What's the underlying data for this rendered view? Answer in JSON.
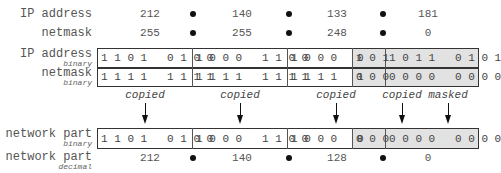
{
  "rows": {
    "ip_decimal": {
      "label": "IP address",
      "octets": [
        "212",
        "140",
        "133",
        "181"
      ]
    },
    "netmask_decimal": {
      "label": "netmask",
      "octets": [
        "255",
        "255",
        "248",
        "0"
      ]
    },
    "ip_binary": {
      "label": "IP address",
      "sublabel": "binary",
      "octets": [
        "1 1 0 1   0 1 0 0",
        "1 0 0 0   1 1 0 0",
        "1 0 0 0   0",
        "1 0 1",
        "1 0 1 1   0 1 0 1"
      ]
    },
    "netmask_binary": {
      "label": "netmask",
      "sublabel": "binary",
      "octets": [
        "1 1 1 1   1 1 1 1",
        "1 1 1 1   1 1 1 1",
        "1 1 1 1   1",
        "0 0 0",
        "0 0 0 0   0 0 0 0"
      ]
    },
    "network_binary": {
      "label": "network part",
      "sublabel": "binary",
      "octets": [
        "1 1 0 1   0 1 0 0",
        "1 0 0 0   1 1 0 0",
        "1 0 0 0   0",
        "0 0 0",
        "0 0 0 0   0 0 0 0"
      ]
    },
    "network_decimal": {
      "label": "network part",
      "sublabel": "decimal",
      "octets": [
        "212",
        "140",
        "128",
        "0"
      ]
    }
  },
  "annotations": [
    "copied",
    "copied",
    "copied",
    "copied",
    "masked"
  ],
  "colors": {
    "shade": "#e2e2e2",
    "border": "#333333",
    "dot": "#111111"
  }
}
